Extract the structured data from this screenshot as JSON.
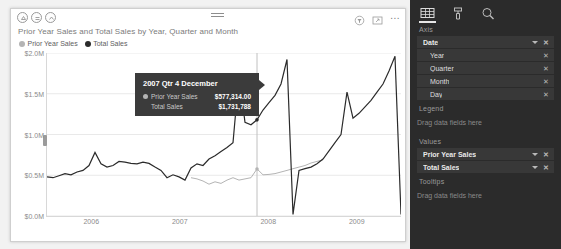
{
  "visual": {
    "title": "Prior Year Sales and Total Sales by Year, Quarter and Month",
    "header_icons": {
      "drill_up": "drill-up-icon",
      "drill_down": "drill-down-icon",
      "expand_hierarchy": "expand-hierarchy-icon",
      "hamburger": "hamburger-icon",
      "filter": "filter-icon",
      "focus_mode": "focus-mode-icon",
      "more_options": "..."
    },
    "legend": [
      {
        "label": "Prior Year Sales",
        "color": "#b4b4b4"
      },
      {
        "label": "Total Sales",
        "color": "#2b2b2b"
      }
    ]
  },
  "tooltip": {
    "title": "2007 Qtr 4 December",
    "rows": [
      {
        "name": "Prior Year Sales",
        "value": "$577,314.00",
        "color": "#b4b4b4",
        "has_dot": true
      },
      {
        "name": "Total Sales",
        "value": "$1,731,788",
        "color": "#2b2b2b",
        "has_dot": false
      }
    ]
  },
  "chart_data": {
    "type": "line",
    "title": "Prior Year Sales and Total Sales by Year, Quarter and Month",
    "xlabel": "",
    "ylabel": "",
    "ylim": [
      0,
      2000000
    ],
    "yticks": [
      0,
      500000,
      1000000,
      1500000,
      2000000
    ],
    "ytick_labels": [
      "$0.0M",
      "$0.5M",
      "$1.0M",
      "$1.5M",
      "$2.0M"
    ],
    "xticks": [
      "2006",
      "2007",
      "2008",
      "2009"
    ],
    "grid": true,
    "legend_position": "top-left",
    "annotation": {
      "hover_x_index": 35,
      "label": "2007 Qtr 4 December",
      "prior_year_sales": 577314.0,
      "total_sales": 1731788
    },
    "series": [
      {
        "name": "Prior Year Sales",
        "color": "#b4b4b4",
        "values": [
          0,
          0,
          0,
          0,
          0,
          0,
          0,
          0,
          0,
          0,
          0,
          0,
          0,
          0,
          0,
          0,
          0,
          0,
          0,
          0,
          0,
          0,
          0,
          0,
          470000,
          455000,
          430000,
          390000,
          420000,
          400000,
          440000,
          470000,
          440000,
          455000,
          470000,
          577314,
          505000,
          510000,
          520000,
          540000,
          560000,
          580000,
          600000,
          620000,
          650000,
          670000,
          690000,
          0,
          0,
          0,
          0,
          0,
          0,
          0,
          0,
          0,
          0,
          0,
          0,
          0
        ]
      },
      {
        "name": "Total Sales",
        "color": "#2b2b2b",
        "values": [
          480000,
          470000,
          495000,
          520000,
          505000,
          540000,
          560000,
          620000,
          780000,
          640000,
          600000,
          620000,
          670000,
          660000,
          645000,
          640000,
          660000,
          645000,
          600000,
          560000,
          470000,
          505000,
          480000,
          440000,
          590000,
          640000,
          620000,
          700000,
          740000,
          790000,
          840000,
          900000,
          1731788,
          1150000,
          1120000,
          1180000,
          1300000,
          1390000,
          1480000,
          1620000,
          1920000,
          20000,
          560000,
          580000,
          600000,
          640000,
          700000,
          800000,
          900000,
          1000000,
          1520000,
          1200000,
          1260000,
          1340000,
          1420000,
          1520000,
          1620000,
          1780000,
          1960000,
          20000
        ]
      }
    ]
  },
  "fields_pane": {
    "tabs": [
      {
        "name": "fields-tab",
        "icon": "fields-table-icon",
        "active": true
      },
      {
        "name": "format-tab",
        "icon": "paint-roller-icon",
        "active": false
      },
      {
        "name": "analytics-tab",
        "icon": "magnifier-icon",
        "active": false
      }
    ],
    "wells": [
      {
        "label": "Axis",
        "fields": [
          {
            "name": "Date",
            "level": "parent",
            "caret": true,
            "remove": "✕"
          },
          {
            "name": "Year",
            "level": "child",
            "caret": false,
            "remove": "✕"
          },
          {
            "name": "Quarter",
            "level": "child",
            "caret": false,
            "remove": "✕"
          },
          {
            "name": "Month",
            "level": "child",
            "caret": false,
            "remove": "✕"
          },
          {
            "name": "Day",
            "level": "child",
            "caret": false,
            "remove": "✕"
          }
        ],
        "empty_text": ""
      },
      {
        "label": "Legend",
        "fields": [],
        "empty_text": "Drag data fields here"
      },
      {
        "label": "Values",
        "fields": [
          {
            "name": "Prior Year Sales",
            "level": "parent",
            "caret": true,
            "remove": "✕"
          },
          {
            "name": "Total Sales",
            "level": "parent",
            "caret": true,
            "remove": "✕"
          }
        ],
        "empty_text": ""
      },
      {
        "label": "Tooltips",
        "fields": [],
        "empty_text": "Drag data fields here"
      }
    ]
  }
}
